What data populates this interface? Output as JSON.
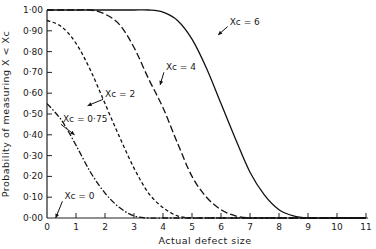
{
  "chart_data": {
    "type": "line",
    "title": "",
    "xlabel": "Actual defect size",
    "ylabel": "Probability of measuring X < Xc",
    "xlim": [
      0,
      11
    ],
    "ylim": [
      0,
      1.0
    ],
    "grid": false,
    "legend_position": "inline annotations",
    "x_ticks": [
      "0",
      "1",
      "2",
      "3",
      "4",
      "5",
      "6",
      "7",
      "8",
      "9",
      "10",
      "11"
    ],
    "y_ticks": [
      "0·00",
      "0·10",
      "0·20",
      "0·30",
      "0·40",
      "0·50",
      "0·60",
      "0·70",
      "0·80",
      "0·90",
      "1·00"
    ],
    "x": [
      0,
      0.5,
      1,
      1.5,
      2,
      2.5,
      3,
      3.5,
      4,
      4.5,
      5,
      5.5,
      6,
      6.5,
      7,
      7.5,
      8,
      8.5,
      9,
      9.5,
      10,
      10.5,
      11
    ],
    "series": [
      {
        "name": "Xc = 0",
        "style": "solid",
        "values": [
          0,
          0,
          0,
          0,
          0,
          0,
          0,
          0,
          0,
          0,
          0,
          0,
          0,
          0,
          0,
          0,
          0,
          0,
          0,
          0,
          0,
          0,
          0
        ]
      },
      {
        "name": "Xc = 0·75",
        "style": "dashdot",
        "values": [
          0.55,
          0.47,
          0.35,
          0.22,
          0.12,
          0.05,
          0.01,
          0,
          0,
          0,
          0,
          0,
          0,
          0,
          0,
          0,
          0,
          0,
          0,
          0,
          0,
          0,
          0
        ]
      },
      {
        "name": "Xc = 2",
        "style": "shortdash",
        "values": [
          0.95,
          0.92,
          0.84,
          0.71,
          0.55,
          0.39,
          0.24,
          0.12,
          0.05,
          0.01,
          0,
          0,
          0,
          0,
          0,
          0,
          0,
          0,
          0,
          0,
          0,
          0,
          0
        ]
      },
      {
        "name": "Xc = 4",
        "style": "dash",
        "values": [
          1.0,
          1.0,
          1.0,
          1.0,
          0.98,
          0.93,
          0.82,
          0.67,
          0.53,
          0.36,
          0.2,
          0.1,
          0.04,
          0.01,
          0,
          0,
          0,
          0,
          0,
          0,
          0,
          0,
          0
        ]
      },
      {
        "name": "Xc = 6",
        "style": "solid",
        "values": [
          1.0,
          1.0,
          1.0,
          1.0,
          1.0,
          1.0,
          1.0,
          1.0,
          0.99,
          0.95,
          0.86,
          0.72,
          0.55,
          0.38,
          0.22,
          0.11,
          0.04,
          0.01,
          0,
          0,
          0,
          0,
          0
        ]
      }
    ],
    "annotations": [
      {
        "text": "Xc = 6",
        "x": 6.3,
        "y": 0.93,
        "arrow_to": [
          5.9,
          0.88
        ]
      },
      {
        "text": "Xc = 4",
        "x": 4.1,
        "y": 0.71,
        "arrow_to": [
          3.9,
          0.64
        ]
      },
      {
        "text": "Xc = 2",
        "x": 2.0,
        "y": 0.58,
        "arrow_to": [
          1.4,
          0.54
        ]
      },
      {
        "text": "Xc = 0·75",
        "x": 0.55,
        "y": 0.46,
        "arrow_to": [
          0.95,
          0.4
        ]
      },
      {
        "text": "Xc = 0",
        "x": 0.6,
        "y": 0.09,
        "arrow_to": [
          0.3,
          0.0
        ]
      }
    ]
  }
}
